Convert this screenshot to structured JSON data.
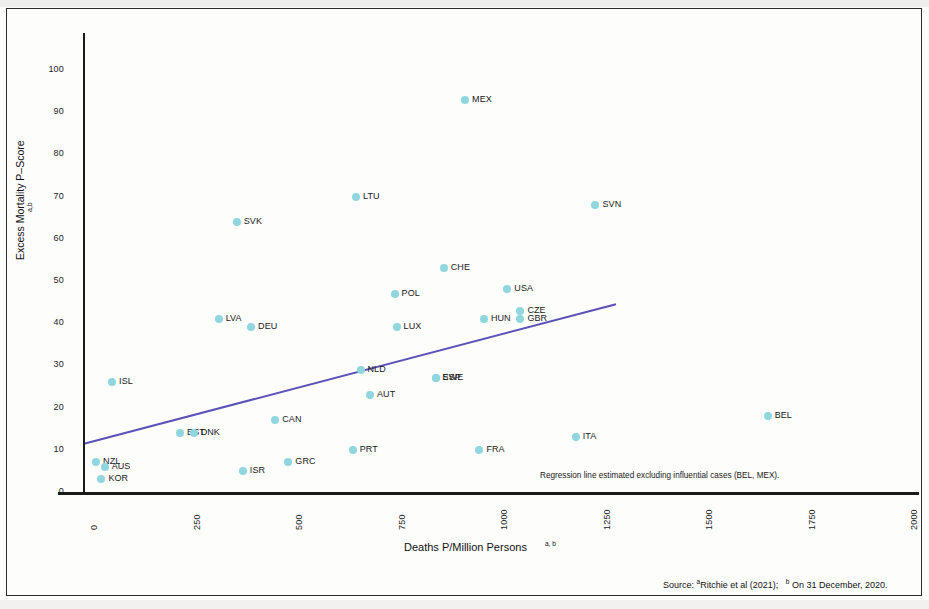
{
  "figure": {
    "y_axis_label": "Excess Mortality P–Score",
    "y_axis_label_sup": "a,b",
    "x_axis_label": "Deaths P/Million Persons",
    "x_axis_label_sup": "a, b",
    "regression_note": "Regression line estimated excluding influential cases (BEL, MEX).",
    "source_prefix": "Source:",
    "source_a_sup": "a",
    "source_a": "Ritchie et al (2021);",
    "source_b_sup": "b",
    "source_b": "On 31 December, 2020.",
    "marker_color": "#90d6de",
    "regression_color": "#5b52b8",
    "axis_color": "#1a1a1a"
  },
  "chart_data": {
    "type": "scatter",
    "title": "",
    "xlabel": "Deaths P/Million Persons",
    "ylabel": "Excess Mortality P–Score",
    "xlim": [
      0,
      2000
    ],
    "ylim": [
      0,
      105
    ],
    "xticks": [
      0,
      250,
      500,
      750,
      1000,
      1250,
      1500,
      1750,
      2000
    ],
    "yticks": [
      0,
      10,
      20,
      30,
      40,
      50,
      60,
      70,
      80,
      90,
      100
    ],
    "grid": false,
    "legend": "none",
    "points": [
      {
        "label": "MEX",
        "x": 927,
        "y": 93
      },
      {
        "label": "LTU",
        "x": 661,
        "y": 70
      },
      {
        "label": "SVN",
        "x": 1245,
        "y": 68
      },
      {
        "label": "SVK",
        "x": 370,
        "y": 64
      },
      {
        "label": "CHE",
        "x": 875,
        "y": 53
      },
      {
        "label": "USA",
        "x": 1030,
        "y": 48
      },
      {
        "label": "POL",
        "x": 755,
        "y": 47
      },
      {
        "label": "CZE",
        "x": 1062,
        "y": 43
      },
      {
        "label": "GBR",
        "x": 1062,
        "y": 41
      },
      {
        "label": "HUN",
        "x": 973,
        "y": 41
      },
      {
        "label": "LVA",
        "x": 326,
        "y": 41
      },
      {
        "label": "DEU",
        "x": 405,
        "y": 39
      },
      {
        "label": "LUX",
        "x": 760,
        "y": 39
      },
      {
        "label": "NLD",
        "x": 672,
        "y": 29
      },
      {
        "label": "ISL",
        "x": 66,
        "y": 26
      },
      {
        "label": "SWE",
        "x": 855,
        "y": 27
      },
      {
        "label": "ESP",
        "x": 855,
        "y": 27
      },
      {
        "label": "AUT",
        "x": 695,
        "y": 23
      },
      {
        "label": "BEL",
        "x": 1665,
        "y": 18
      },
      {
        "label": "CAN",
        "x": 464,
        "y": 17
      },
      {
        "label": "EST",
        "x": 232,
        "y": 14
      },
      {
        "label": "DNK",
        "x": 265,
        "y": 14
      },
      {
        "label": "ITA",
        "x": 1197,
        "y": 13
      },
      {
        "label": "PRT",
        "x": 653,
        "y": 10
      },
      {
        "label": "FRA",
        "x": 962,
        "y": 10
      },
      {
        "label": "GRC",
        "x": 496,
        "y": 7
      },
      {
        "label": "NZL",
        "x": 27,
        "y": 7
      },
      {
        "label": "AUS",
        "x": 48,
        "y": 6
      },
      {
        "label": "ISR",
        "x": 385,
        "y": 5
      },
      {
        "label": "KOR",
        "x": 40,
        "y": 3
      }
    ],
    "regression_line": {
      "x_start": 0,
      "y_start": 11.5,
      "x_end": 1295,
      "y_end": 44.5,
      "excluded_cases": [
        "BEL",
        "MEX"
      ]
    }
  }
}
